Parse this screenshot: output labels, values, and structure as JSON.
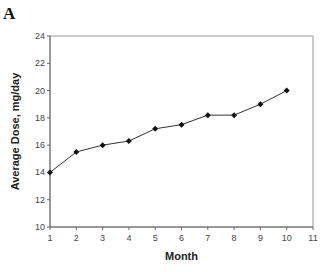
{
  "panel_label": "A",
  "chart_data": {
    "type": "line",
    "title": "",
    "xlabel": "Month",
    "ylabel": "Average Dose, mg/day",
    "x": [
      1,
      2,
      3,
      4,
      5,
      6,
      7,
      8,
      9,
      10
    ],
    "series": [
      {
        "name": "Average Dose",
        "values": [
          14.0,
          15.5,
          16.0,
          16.3,
          17.2,
          17.5,
          18.2,
          18.2,
          19.0,
          20.0
        ]
      }
    ],
    "xlim": [
      1,
      11
    ],
    "ylim": [
      10,
      24
    ],
    "xticks": [
      1,
      2,
      3,
      4,
      5,
      6,
      7,
      8,
      9,
      10,
      11
    ],
    "yticks": [
      10,
      12,
      14,
      16,
      18,
      20,
      22,
      24
    ],
    "grid": false,
    "marker": "diamond",
    "line_color": "#333333"
  }
}
